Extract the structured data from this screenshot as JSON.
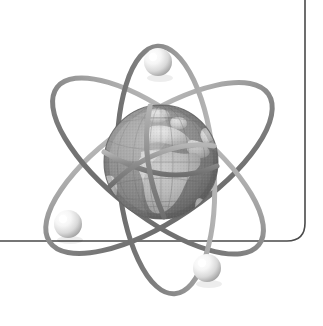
{
  "canvas": {
    "width": 323,
    "height": 326,
    "background_color": "#ffffff",
    "title": "Atom with Earth nucleus logo"
  },
  "frame": {
    "name": "rounded-corner-rule",
    "stroke_color": "#4a4a4a",
    "stroke_width": 1.6,
    "vertical_line_x": 305,
    "vertical_line_top_y": 0,
    "horizontal_line_y": 241,
    "horizontal_line_left_x": 0,
    "corner_radius": 18
  },
  "globe": {
    "name": "earth-globe",
    "center_x": 161,
    "center_y": 162,
    "radius": 57,
    "ocean_color": "#8e8e8e",
    "ocean_shadow_color": "#5c5c5c",
    "land_color": "#c9c9c9",
    "land_highlight_color": "#dcdcdc",
    "graticule_color": "#767676",
    "landmasses": [
      "Europe",
      "Africa",
      "Middle East",
      "Greenland",
      "South America edge"
    ]
  },
  "orbits": [
    {
      "name": "orbit-ring-1",
      "center_x": 159,
      "center_y": 168,
      "rx": 132,
      "ry": 52,
      "rotation_deg": -34,
      "stroke_color": "#8b8b8b",
      "stroke_width": 5
    },
    {
      "name": "orbit-ring-2",
      "center_x": 158,
      "center_y": 166,
      "rx": 128,
      "ry": 50,
      "rotation_deg": 38,
      "stroke_color": "#8b8b8b",
      "stroke_width": 5
    },
    {
      "name": "orbit-ring-3",
      "center_x": 166,
      "center_y": 170,
      "rx": 124,
      "ry": 48,
      "rotation_deg": 86,
      "stroke_color": "#8b8b8b",
      "stroke_width": 5
    }
  ],
  "electrons": [
    {
      "name": "electron-top",
      "center_x": 158,
      "center_y": 62,
      "radius": 14,
      "fill_color": "#fefefe",
      "shade_color": "#b4b4b4"
    },
    {
      "name": "electron-left",
      "center_x": 68,
      "center_y": 224,
      "radius": 14,
      "fill_color": "#fefefe",
      "shade_color": "#b4b4b4"
    },
    {
      "name": "electron-bottom-right",
      "center_x": 207,
      "center_y": 268,
      "radius": 14,
      "fill_color": "#fefefe",
      "shade_color": "#b4b4b4"
    }
  ],
  "palette": {
    "background": "#ffffff",
    "line_dark": "#4a4a4a",
    "orbit_gray": "#8b8b8b",
    "globe_mid_gray": "#8e8e8e",
    "globe_light_gray": "#c9c9c9",
    "electron_white": "#fefefe"
  }
}
